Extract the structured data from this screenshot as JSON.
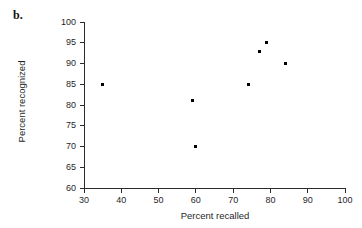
{
  "figure": {
    "panel_label": "b."
  },
  "chart_data": {
    "type": "scatter",
    "title": "",
    "xlabel": "Percent recalled",
    "ylabel": "Percent recognized",
    "xlim": [
      30,
      100
    ],
    "ylim": [
      60,
      100
    ],
    "xticks": [
      30,
      40,
      50,
      60,
      70,
      80,
      90,
      100
    ],
    "yticks": [
      60,
      65,
      70,
      75,
      80,
      85,
      90,
      95,
      100
    ],
    "xtick_labels": [
      "30",
      "40",
      "50",
      "60",
      "70",
      "80",
      "90",
      "100"
    ],
    "ytick_labels": [
      "60",
      "65",
      "70",
      "75",
      "80",
      "85",
      "90",
      "95",
      "100"
    ],
    "grid": false,
    "legend": null,
    "marker_color": "#000000",
    "axis_color": "#2b2b2b",
    "points": [
      {
        "x": 35,
        "y": 85
      },
      {
        "x": 59,
        "y": 81
      },
      {
        "x": 60,
        "y": 70
      },
      {
        "x": 74,
        "y": 85
      },
      {
        "x": 77,
        "y": 93
      },
      {
        "x": 79,
        "y": 95
      },
      {
        "x": 84,
        "y": 90
      }
    ]
  }
}
